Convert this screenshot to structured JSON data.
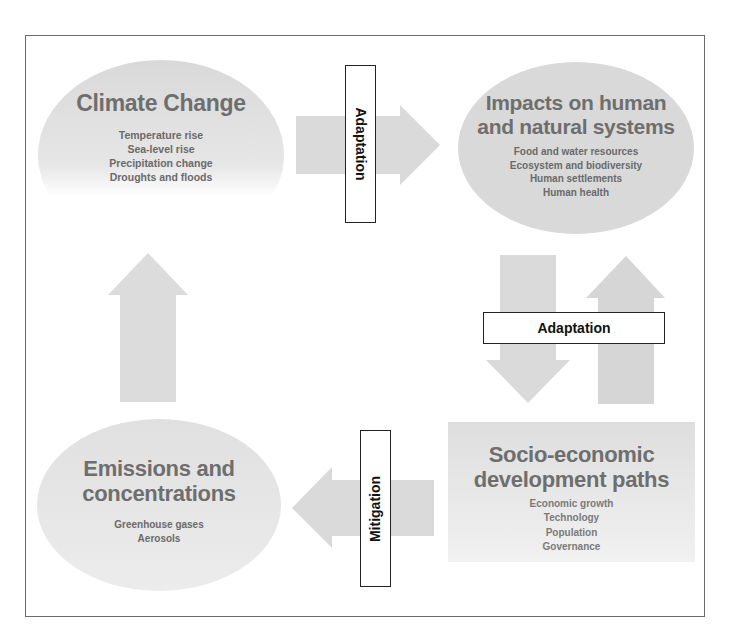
{
  "nodes": {
    "climate_change": {
      "title": "Climate Change",
      "items": [
        "Temperature rise",
        "Sea-level rise",
        "Precipitation change",
        "Droughts and floods"
      ]
    },
    "impacts": {
      "title_line1": "Impacts on human",
      "title_line2": "and natural systems",
      "items": [
        "Food and water resources",
        "Ecosystem and biodiversity",
        "Human settlements",
        "Human health"
      ]
    },
    "socio_economic": {
      "title_line1": "Socio-economic",
      "title_line2": "development paths",
      "items": [
        "Economic growth",
        "Technology",
        "Population",
        "Governance"
      ]
    },
    "emissions": {
      "title_line1": "Emissions and",
      "title_line2": "concentrations",
      "items": [
        "Greenhouse gases",
        "Aerosols"
      ]
    }
  },
  "labels": {
    "adaptation_top": "Adaptation",
    "adaptation_right": "Adaptation",
    "mitigation": "Mitigation"
  },
  "colors": {
    "shape_fill": "#dcdcdc",
    "arrow_fill": "#d9d9d9",
    "text_gray": "#6e6e6e",
    "border": "#222222"
  }
}
